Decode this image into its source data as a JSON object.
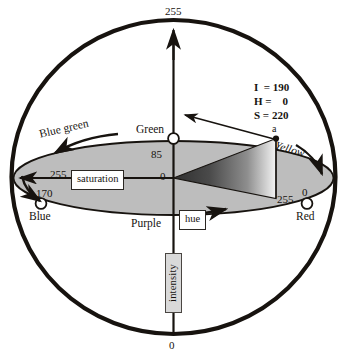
{
  "figure": {
    "title_faint": "",
    "axis": {
      "top_value": "255",
      "bottom_value": "0",
      "axis_label": "intensity"
    },
    "plane": {
      "saturation_label": "saturation",
      "hue_label": "hue",
      "center_value": "0",
      "green_tick_value": "85",
      "saturation_max_value": "255"
    },
    "hue_points": [
      {
        "name": "Green",
        "value": "85",
        "x": 173,
        "y": 138
      },
      {
        "name": "Blue",
        "value": "170",
        "x": 41,
        "y": 203
      },
      {
        "name": "Red",
        "value": "0",
        "x": 307,
        "y": 203,
        "value2": "255"
      }
    ],
    "sector_labels": [
      {
        "name": "Blue green",
        "italic": false
      },
      {
        "name": "Yellow",
        "italic": true
      },
      {
        "name": "Purple",
        "italic": false
      }
    ],
    "callout": {
      "lines": [
        "I  = 190",
        "H =    0",
        "S = 220"
      ],
      "point_label": "a"
    },
    "colors": {
      "outline": "#17130f",
      "plane_fill": "#bdbdbd",
      "wedge_dark": "#3a3a3a",
      "wedge_light": "#f2f2f2",
      "box_bg": "#ffffff",
      "intensity_box_bg": "#d9d9d9",
      "text": "#16130f",
      "background": "#ffffff"
    }
  }
}
